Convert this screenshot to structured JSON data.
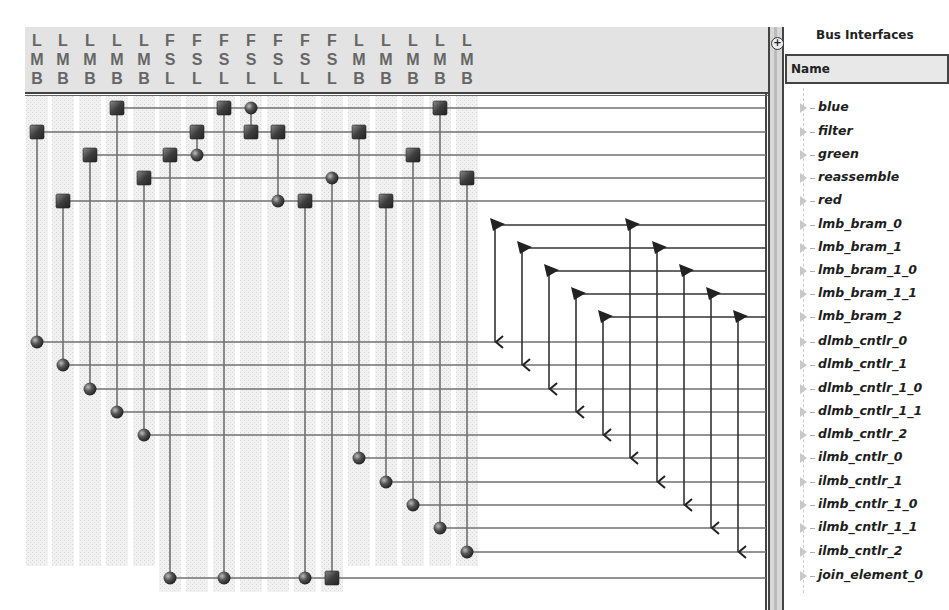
{
  "bus_columns": [
    {
      "label": "LMB",
      "x": 37
    },
    {
      "label": "LMB",
      "x": 63
    },
    {
      "label": "LMB",
      "x": 90
    },
    {
      "label": "LMB",
      "x": 117
    },
    {
      "label": "LMB",
      "x": 144
    },
    {
      "label": "FSL",
      "x": 170
    },
    {
      "label": "FSL",
      "x": 197
    },
    {
      "label": "FSL",
      "x": 224
    },
    {
      "label": "FSL",
      "x": 251
    },
    {
      "label": "FSL",
      "x": 278
    },
    {
      "label": "FSL",
      "x": 305
    },
    {
      "label": "FSL",
      "x": 332
    },
    {
      "label": "LMB",
      "x": 359
    },
    {
      "label": "LMB",
      "x": 386
    },
    {
      "label": "LMB",
      "x": 413
    },
    {
      "label": "LMB",
      "x": 440
    },
    {
      "label": "LMB",
      "x": 467
    }
  ],
  "bus_interfaces_panel": {
    "title": "Bus Interfaces",
    "column_header": "Name",
    "items": [
      {
        "name": "blue"
      },
      {
        "name": "filter"
      },
      {
        "name": "green"
      },
      {
        "name": "reassemble"
      },
      {
        "name": "red"
      },
      {
        "name": "lmb_bram_0"
      },
      {
        "name": "lmb_bram_1"
      },
      {
        "name": "lmb_bram_1_0"
      },
      {
        "name": "lmb_bram_1_1"
      },
      {
        "name": "lmb_bram_2"
      },
      {
        "name": "dlmb_cntlr_0"
      },
      {
        "name": "dlmb_cntlr_1"
      },
      {
        "name": "dlmb_cntlr_1_0"
      },
      {
        "name": "dlmb_cntlr_1_1"
      },
      {
        "name": "dlmb_cntlr_2"
      },
      {
        "name": "ilmb_cntlr_0"
      },
      {
        "name": "ilmb_cntlr_1"
      },
      {
        "name": "ilmb_cntlr_1_0"
      },
      {
        "name": "ilmb_cntlr_1_1"
      },
      {
        "name": "ilmb_cntlr_2"
      },
      {
        "name": "join_element_0"
      }
    ],
    "row_y": [
      108,
      132,
      155,
      178,
      201,
      225,
      248,
      271,
      294,
      317,
      342,
      365,
      389,
      412,
      435,
      458,
      482,
      505,
      528,
      552,
      576
    ]
  },
  "connections": {
    "rows": [
      {
        "y": 108,
        "start_x": 117,
        "nodes": [
          {
            "x": 117,
            "t": "sq"
          },
          {
            "x": 224,
            "t": "sq"
          },
          {
            "x": 251,
            "t": "ci"
          },
          {
            "x": 440,
            "t": "sq"
          }
        ]
      },
      {
        "y": 132,
        "start_x": 37,
        "nodes": [
          {
            "x": 37,
            "t": "sq"
          },
          {
            "x": 197,
            "t": "sq"
          },
          {
            "x": 251,
            "t": "sq"
          },
          {
            "x": 278,
            "t": "sq"
          },
          {
            "x": 359,
            "t": "sq"
          }
        ]
      },
      {
        "y": 155,
        "start_x": 90,
        "nodes": [
          {
            "x": 90,
            "t": "sq"
          },
          {
            "x": 170,
            "t": "sq"
          },
          {
            "x": 197,
            "t": "ci"
          },
          {
            "x": 413,
            "t": "sq"
          }
        ]
      },
      {
        "y": 178,
        "start_x": 144,
        "nodes": [
          {
            "x": 144,
            "t": "sq"
          },
          {
            "x": 332,
            "t": "ci"
          },
          {
            "x": 467,
            "t": "sq"
          }
        ]
      },
      {
        "y": 201,
        "start_x": 63,
        "nodes": [
          {
            "x": 63,
            "t": "sq"
          },
          {
            "x": 278,
            "t": "ci"
          },
          {
            "x": 305,
            "t": "sq"
          },
          {
            "x": 386,
            "t": "sq"
          }
        ]
      },
      {
        "y": 225,
        "start_x": 495,
        "nodes": [
          {
            "x": 495,
            "t": "tri"
          },
          {
            "x": 630,
            "t": "tri"
          }
        ]
      },
      {
        "y": 248,
        "start_x": 522,
        "nodes": [
          {
            "x": 522,
            "t": "tri"
          },
          {
            "x": 657,
            "t": "tri"
          }
        ]
      },
      {
        "y": 271,
        "start_x": 549,
        "nodes": [
          {
            "x": 549,
            "t": "tri"
          },
          {
            "x": 684,
            "t": "tri"
          }
        ]
      },
      {
        "y": 294,
        "start_x": 576,
        "nodes": [
          {
            "x": 576,
            "t": "tri"
          },
          {
            "x": 711,
            "t": "tri"
          }
        ]
      },
      {
        "y": 317,
        "start_x": 603,
        "nodes": [
          {
            "x": 603,
            "t": "tri"
          },
          {
            "x": 738,
            "t": "tri"
          }
        ]
      },
      {
        "y": 342,
        "start_x": 37,
        "nodes": [
          {
            "x": 37,
            "t": "ci"
          },
          {
            "x": 495,
            "t": "arr"
          }
        ]
      },
      {
        "y": 365,
        "start_x": 63,
        "nodes": [
          {
            "x": 63,
            "t": "ci"
          },
          {
            "x": 522,
            "t": "arr"
          }
        ]
      },
      {
        "y": 389,
        "start_x": 90,
        "nodes": [
          {
            "x": 90,
            "t": "ci"
          },
          {
            "x": 549,
            "t": "arr"
          }
        ]
      },
      {
        "y": 412,
        "start_x": 117,
        "nodes": [
          {
            "x": 117,
            "t": "ci"
          },
          {
            "x": 576,
            "t": "arr"
          }
        ]
      },
      {
        "y": 435,
        "start_x": 144,
        "nodes": [
          {
            "x": 144,
            "t": "ci"
          },
          {
            "x": 603,
            "t": "arr"
          }
        ]
      },
      {
        "y": 458,
        "start_x": 359,
        "nodes": [
          {
            "x": 359,
            "t": "ci"
          },
          {
            "x": 630,
            "t": "arr"
          }
        ]
      },
      {
        "y": 482,
        "start_x": 386,
        "nodes": [
          {
            "x": 386,
            "t": "ci"
          },
          {
            "x": 657,
            "t": "arr"
          }
        ]
      },
      {
        "y": 505,
        "start_x": 413,
        "nodes": [
          {
            "x": 413,
            "t": "ci"
          },
          {
            "x": 684,
            "t": "arr"
          }
        ]
      },
      {
        "y": 528,
        "start_x": 440,
        "nodes": [
          {
            "x": 440,
            "t": "ci"
          },
          {
            "x": 711,
            "t": "arr"
          }
        ]
      },
      {
        "y": 552,
        "start_x": 467,
        "nodes": [
          {
            "x": 467,
            "t": "ci"
          },
          {
            "x": 738,
            "t": "arr"
          }
        ]
      },
      {
        "y": 578,
        "start_x": 170,
        "nodes": [
          {
            "x": 170,
            "t": "ci"
          },
          {
            "x": 224,
            "t": "ci"
          },
          {
            "x": 305,
            "t": "ci"
          },
          {
            "x": 332,
            "t": "sq"
          }
        ]
      }
    ],
    "verticals": [
      {
        "x": 37,
        "y1": 132,
        "y2": 342
      },
      {
        "x": 63,
        "y1": 201,
        "y2": 365
      },
      {
        "x": 90,
        "y1": 155,
        "y2": 389
      },
      {
        "x": 117,
        "y1": 108,
        "y2": 412
      },
      {
        "x": 144,
        "y1": 178,
        "y2": 435
      },
      {
        "x": 170,
        "y1": 155,
        "y2": 578
      },
      {
        "x": 197,
        "y1": 132,
        "y2": 155
      },
      {
        "x": 224,
        "y1": 108,
        "y2": 578
      },
      {
        "x": 251,
        "y1": 108,
        "y2": 132
      },
      {
        "x": 278,
        "y1": 132,
        "y2": 201
      },
      {
        "x": 305,
        "y1": 201,
        "y2": 578
      },
      {
        "x": 332,
        "y1": 178,
        "y2": 578
      },
      {
        "x": 359,
        "y1": 132,
        "y2": 458
      },
      {
        "x": 386,
        "y1": 201,
        "y2": 482
      },
      {
        "x": 413,
        "y1": 155,
        "y2": 505
      },
      {
        "x": 440,
        "y1": 108,
        "y2": 528
      },
      {
        "x": 467,
        "y1": 178,
        "y2": 552
      },
      {
        "x": 495,
        "y1": 225,
        "y2": 342
      },
      {
        "x": 522,
        "y1": 248,
        "y2": 365
      },
      {
        "x": 549,
        "y1": 271,
        "y2": 389
      },
      {
        "x": 576,
        "y1": 294,
        "y2": 412
      },
      {
        "x": 603,
        "y1": 317,
        "y2": 435
      },
      {
        "x": 630,
        "y1": 225,
        "y2": 458
      },
      {
        "x": 657,
        "y1": 248,
        "y2": 482
      },
      {
        "x": 684,
        "y1": 271,
        "y2": 505
      },
      {
        "x": 711,
        "y1": 294,
        "y2": 528
      },
      {
        "x": 738,
        "y1": 317,
        "y2": 552
      }
    ]
  },
  "colors": {
    "header_bg": "#e3e3e3",
    "label_gray": "#666666",
    "line": "#707070",
    "node": "#3a3a3a",
    "column_shade": "#ebebeb"
  }
}
